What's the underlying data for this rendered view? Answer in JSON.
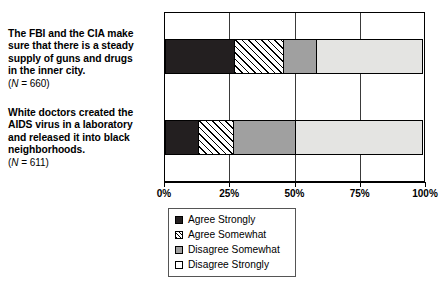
{
  "chart_data": {
    "type": "bar",
    "orientation": "horizontal",
    "stacked": true,
    "stack_mode": "percent",
    "title": "",
    "subtitle": "",
    "xlabel": "",
    "ylabel": "",
    "xlim": [
      0,
      100
    ],
    "xticks": [
      0,
      25,
      50,
      75,
      100
    ],
    "xticklabels": [
      "0%",
      "25%",
      "50%",
      "75%",
      "100%"
    ],
    "grid": true,
    "grid_axis": "x",
    "legend_position": "below-center",
    "categories": [
      "The FBI and the CIA make sure that there is a steady supply of guns and drugs in the inner city.",
      "White doctors created the AIDS virus in a laboratory and released it into black neighborhoods."
    ],
    "category_sample_sizes": [
      "(N = 660)",
      "(N = 611)"
    ],
    "series": [
      {
        "name": "Agree Strongly",
        "values": [
          27,
          13
        ]
      },
      {
        "name": "Agree Somewhat",
        "values": [
          19,
          14
        ]
      },
      {
        "name": "Disagree Somewhat",
        "values": [
          13,
          24
        ]
      },
      {
        "name": "Disagree Strongly",
        "values": [
          41,
          49
        ]
      }
    ],
    "colors": {
      "Agree Strongly": "#231f20",
      "Agree Somewhat": "#ffffff",
      "Disagree Somewhat": "#a0a0a0",
      "Disagree Strongly": "#e4e4e2"
    }
  },
  "categories": [
    {
      "line1": "The FBI and the CIA make",
      "line2": "sure that there is a steady",
      "line3": "supply of guns and drugs",
      "line4": "in the inner city.",
      "n_prefix": "(",
      "n_italic": "N",
      "n_suffix": " = 660)"
    },
    {
      "line1": "White doctors created the",
      "line2": "AIDS virus in a laboratory",
      "line3": "and released it into black",
      "line4": "neighborhoods.",
      "n_prefix": "(",
      "n_italic": "N",
      "n_suffix": " = 611)"
    }
  ],
  "axis": {
    "ticks": [
      {
        "label": "0%",
        "value": 0
      },
      {
        "label": "25%",
        "value": 25
      },
      {
        "label": "50%",
        "value": 50
      },
      {
        "label": "75%",
        "value": 75
      },
      {
        "label": "100%",
        "value": 100
      }
    ]
  },
  "legend": {
    "items": [
      {
        "label": "Agree Strongly",
        "swatch": "solid-black"
      },
      {
        "label": "Agree Somewhat",
        "swatch": "diagonal-hatch"
      },
      {
        "label": "Disagree Somewhat",
        "swatch": "solid-gray"
      },
      {
        "label": "Disagree Strongly",
        "swatch": "solid-white"
      }
    ]
  }
}
